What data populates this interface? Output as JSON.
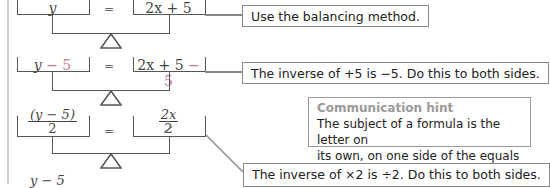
{
  "diagram": {
    "steps": [
      {
        "left": {
          "main": "y",
          "extra": ""
        },
        "equals": "=",
        "right": {
          "main": "2x + 5",
          "extra": ""
        },
        "note": "Use the balancing method."
      },
      {
        "left": {
          "main": "y",
          "extra": " − 5"
        },
        "equals": "=",
        "right": {
          "main": "2x + 5",
          "extra": " − 5"
        },
        "note": "The inverse of +5 is −5. Do this to both sides."
      },
      {
        "left": {
          "numerator": "(y − 5)",
          "denominator": "2"
        },
        "equals": "=",
        "right": {
          "numerator": "2x",
          "denominator": "2"
        },
        "note": "The inverse of ×2 is ÷2. Do this to both sides."
      },
      {
        "left": {
          "numerator_partial": "y − 5"
        }
      }
    ],
    "hint": {
      "title": "Communication hint",
      "body_line1": "The subject of a formula is the letter on",
      "body_line2": "its own, on one side of the equals sign."
    },
    "colors": {
      "subtraction_highlight": "#c8798f",
      "box_border": "#8a8a8a",
      "hint_title": "#9a9a9a"
    }
  }
}
